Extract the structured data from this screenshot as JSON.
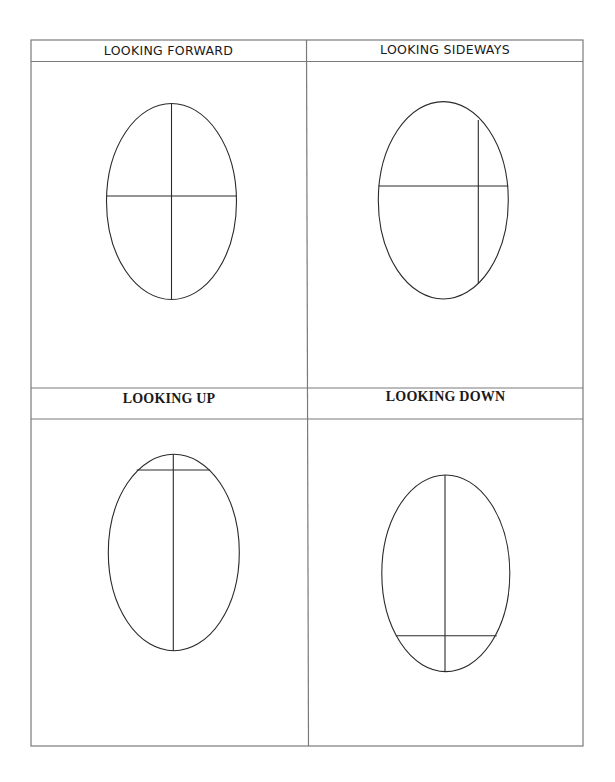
{
  "worksheet": {
    "panels": [
      {
        "id": "forward",
        "title": "LOOKING FORWARD",
        "title_style": "comic-sans-like",
        "ellipse": {
          "cx": 171.5,
          "cy": 201.5,
          "rx": 65,
          "ry": 98
        },
        "guide_vertical": {
          "x1": 171.5,
          "y1": 103.5,
          "x2": 171.5,
          "y2": 299.5
        },
        "guide_horizontal": {
          "x1": 106.5,
          "y1": 196,
          "x2": 236.5,
          "y2": 196
        }
      },
      {
        "id": "sideways",
        "title": "LOOKING SIDEWAYS",
        "title_style": "comic-sans-like",
        "ellipse": {
          "cx": 443.3,
          "cy": 200.3,
          "rx": 65,
          "ry": 98.7
        },
        "guide_vertical": {
          "x1": 478.3,
          "y1": 120,
          "x2": 478.3,
          "y2": 283.3
        },
        "guide_horizontal": {
          "x1": 378.3,
          "y1": 186,
          "x2": 508.3,
          "y2": 186
        }
      },
      {
        "id": "up",
        "title": "LOOKING UP",
        "title_style": "bold-serif",
        "ellipse": {
          "cx": 173.8,
          "cy": 552.5,
          "rx": 65.5,
          "ry": 98.2
        },
        "guide_vertical": {
          "x1": 173.3,
          "y1": 454.3,
          "x2": 173.3,
          "y2": 650.7
        },
        "guide_horizontal": {
          "x1": 136.7,
          "y1": 470,
          "x2": 210,
          "y2": 470
        }
      },
      {
        "id": "down",
        "title": "LOOKING DOWN",
        "title_style": "bold-serif",
        "ellipse": {
          "cx": 445.8,
          "cy": 573.3,
          "rx": 64,
          "ry": 98.3
        },
        "guide_vertical": {
          "x1": 445,
          "y1": 475,
          "x2": 445,
          "y2": 671.7
        },
        "guide_horizontal": {
          "x1": 396,
          "y1": 635.7,
          "x2": 496.7,
          "y2": 635.7
        }
      }
    ],
    "colors": {
      "grid_line": "#7a7a7a",
      "drawing_line": "#2a2a2a",
      "text": "#1a1a1a",
      "background": "#ffffff"
    }
  }
}
